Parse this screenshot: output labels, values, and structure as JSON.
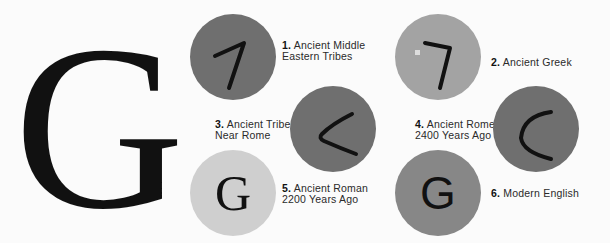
{
  "title_letter": "G",
  "colors": {
    "dark": "#6f6f6f",
    "light_gray": "#a3a3a3",
    "pale": "#cfcfcf",
    "medium": "#878787",
    "ink": "#111111"
  },
  "stages": [
    {
      "num": "1.",
      "line1": "Ancient Middle",
      "line2": "Eastern Tribes",
      "glyph": "7-shape"
    },
    {
      "num": "2.",
      "line1": "Ancient Greek",
      "line2": "",
      "glyph": "gamma"
    },
    {
      "num": "3.",
      "line1": "Ancient Tribe",
      "line2": "Near Rome",
      "glyph": "angle-left"
    },
    {
      "num": "4.",
      "line1": "Ancient Rome",
      "line2": "2400 Years Ago",
      "glyph": "c-curve"
    },
    {
      "num": "5.",
      "line1": "Ancient Roman",
      "line2": "2200 Years Ago",
      "glyph": "G"
    },
    {
      "num": "6.",
      "line1": "Modern English",
      "line2": "",
      "glyph": "G"
    }
  ]
}
